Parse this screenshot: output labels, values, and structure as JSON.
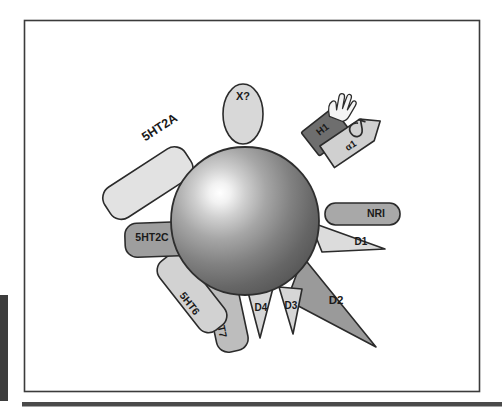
{
  "page": {
    "background_color": "#ffffff",
    "frame": {
      "border_color": "#3b3b3b",
      "fill_color": "#ffffff"
    },
    "left_margin_bar_color": "#3d3d3d",
    "bottom_rule_color": "#4a4a4a"
  },
  "figure": {
    "title": "",
    "caption": "",
    "core": {
      "name": "drug-molecule-sphere",
      "highlight_color": "#ffffff",
      "mid_color": "#8c8c8c",
      "edge_color": "#4f4f4f",
      "outline_color": "#2b2b2b",
      "center_x": 245,
      "center_y": 221,
      "radius": 74
    },
    "receptors": [
      {
        "id": "5ht2a",
        "label": "5HT2A",
        "shape": "rounded-rectangle",
        "fill": "#e2e2e2",
        "stroke": "#2b2b2b",
        "angle_deg": 215,
        "label_rotation_deg": -32
      },
      {
        "id": "x-unknown",
        "label": "X?",
        "shape": "ellipse",
        "fill": "#d8d8d8",
        "stroke": "#2b2b2b",
        "angle_deg": 272,
        "label_rotation_deg": 0
      },
      {
        "id": "h1",
        "label": "H1",
        "shape": "rectangle",
        "fill": "#6e6e6e",
        "stroke": "#2b2b2b",
        "angle_deg": 305,
        "label_rotation_deg": -40,
        "decoration": "hand-burst-icon",
        "decoration_fill": "#f2f2f2"
      },
      {
        "id": "alpha1",
        "label": "α1",
        "shape": "arrow-pentagon",
        "fill": "#d0d0d0",
        "stroke": "#2b2b2b",
        "angle_deg": 325,
        "label_rotation_deg": -40,
        "decoration": "alpha-symbol-icon"
      },
      {
        "id": "nri",
        "label": "NRI",
        "shape": "rounded-rectangle",
        "fill": "#a8a8a8",
        "stroke": "#2b2b2b",
        "angle_deg": 2,
        "label_rotation_deg": 0
      },
      {
        "id": "d1",
        "label": "D1",
        "shape": "triangle",
        "fill": "#dcdcdc",
        "stroke": "#2b2b2b",
        "angle_deg": 20,
        "label_rotation_deg": 0
      },
      {
        "id": "d2",
        "label": "D2",
        "shape": "triangle-large",
        "fill": "#9a9a9a",
        "stroke": "#2b2b2b",
        "angle_deg": 45,
        "label_rotation_deg": 0
      },
      {
        "id": "d3",
        "label": "D3",
        "shape": "triangle",
        "fill": "#d6d6d6",
        "stroke": "#2b2b2b",
        "angle_deg": 72,
        "label_rotation_deg": 0
      },
      {
        "id": "d4",
        "label": "D4",
        "shape": "triangle",
        "fill": "#d6d6d6",
        "stroke": "#2b2b2b",
        "angle_deg": 97,
        "label_rotation_deg": 0
      },
      {
        "id": "5ht7",
        "label": "5HT7",
        "shape": "rounded-rectangle",
        "fill": "#bdbdbd",
        "stroke": "#2b2b2b",
        "angle_deg": 112,
        "label_rotation_deg": 78
      },
      {
        "id": "5ht6",
        "label": "5HT6",
        "shape": "rounded-rectangle",
        "fill": "#d2d2d2",
        "stroke": "#2b2b2b",
        "angle_deg": 134,
        "label_rotation_deg": 52
      },
      {
        "id": "5ht2c",
        "label": "5HT2C",
        "shape": "rounded-rectangle",
        "fill": "#9e9e9e",
        "stroke": "#2b2b2b",
        "angle_deg": 176,
        "label_rotation_deg": 0
      }
    ]
  }
}
